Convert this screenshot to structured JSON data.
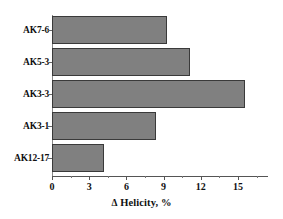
{
  "chart_data": {
    "type": "bar",
    "orientation": "horizontal",
    "title": "",
    "xlabel": "Δ Helicity, %",
    "ylabel": "",
    "categories": [
      "AK7-6",
      "AK5-3",
      "AK3-3",
      "AK3-1",
      "AK12-17"
    ],
    "values": [
      9.3,
      11.1,
      15.6,
      8.4,
      4.2
    ],
    "xlim": [
      0,
      17.5
    ],
    "xticks": [
      0,
      3,
      6,
      9,
      12,
      15
    ],
    "xtick_labels": [
      "0",
      "3",
      "6",
      "9",
      "12",
      "15"
    ],
    "minor_xticks": [
      1.5,
      4.5,
      7.5,
      10.5,
      13.5,
      16.5
    ],
    "grid": false,
    "legend": false,
    "bar_color": "#808080",
    "bar_border_color": "#3a3a3a",
    "axis_color": "#555555"
  },
  "axis": {
    "x_title_delta": "Δ",
    "x_title_text": " Helicity, %"
  }
}
